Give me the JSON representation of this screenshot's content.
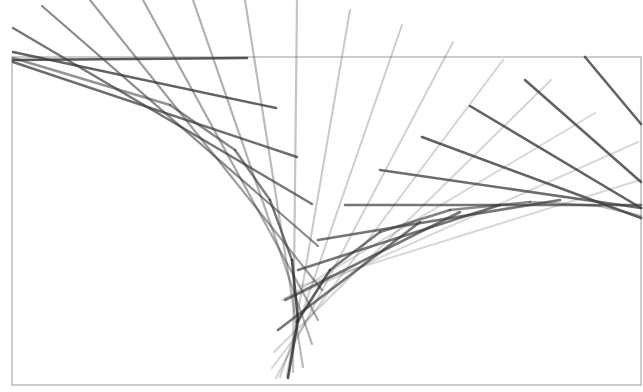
{
  "figure": {
    "width": 643,
    "height": 392,
    "background": "#ffffff",
    "frame": {
      "x": 12,
      "y": 57,
      "width": 629,
      "height": 328,
      "stroke": "#9a9a9a",
      "stroke_width": 1
    },
    "segments": [
      {
        "group": "left-envelope",
        "x1": 13,
        "y1": 60,
        "x2": 247,
        "y2": 58,
        "color": "#3c3c3c",
        "opacity": 0.85,
        "width": 2.6
      },
      {
        "group": "left-envelope",
        "x1": 13,
        "y1": 52,
        "x2": 276,
        "y2": 108,
        "color": "#3c3c3c",
        "opacity": 0.8,
        "width": 2.4
      },
      {
        "group": "left-envelope",
        "x1": 13,
        "y1": 62,
        "x2": 297,
        "y2": 157,
        "color": "#3c3c3c",
        "opacity": 0.75,
        "width": 2.4
      },
      {
        "group": "left-envelope",
        "x1": 13,
        "y1": 28,
        "x2": 312,
        "y2": 204,
        "color": "#3c3c3c",
        "opacity": 0.7,
        "width": 2.4
      },
      {
        "group": "left-envelope",
        "x1": 42,
        "y1": 6,
        "x2": 318,
        "y2": 246,
        "color": "#3c3c3c",
        "opacity": 0.6,
        "width": 2.2
      },
      {
        "group": "left-envelope",
        "x1": 90,
        "y1": 0,
        "x2": 322,
        "y2": 290,
        "color": "#3c3c3c",
        "opacity": 0.5,
        "width": 2.2
      },
      {
        "group": "left-envelope",
        "x1": 143,
        "y1": 0,
        "x2": 318,
        "y2": 320,
        "color": "#3c3c3c",
        "opacity": 0.45,
        "width": 2.2
      },
      {
        "group": "left-envelope",
        "x1": 193,
        "y1": 0,
        "x2": 312,
        "y2": 344,
        "color": "#3c3c3c",
        "opacity": 0.4,
        "width": 2.2
      },
      {
        "group": "left-envelope",
        "x1": 245,
        "y1": 0,
        "x2": 303,
        "y2": 367,
        "color": "#3c3c3c",
        "opacity": 0.35,
        "width": 2.2
      },
      {
        "group": "left-envelope",
        "x1": 297,
        "y1": 0,
        "x2": 293,
        "y2": 372,
        "color": "#3c3c3c",
        "opacity": 0.3,
        "width": 2.2
      },
      {
        "group": "left-envelope",
        "x1": 350,
        "y1": 10,
        "x2": 287,
        "y2": 376,
        "color": "#3c3c3c",
        "opacity": 0.28,
        "width": 2.0
      },
      {
        "group": "left-envelope",
        "x1": 402,
        "y1": 25,
        "x2": 280,
        "y2": 377,
        "color": "#3c3c3c",
        "opacity": 0.26,
        "width": 2.0
      },
      {
        "group": "left-envelope",
        "x1": 453,
        "y1": 42,
        "x2": 276,
        "y2": 378,
        "color": "#3c3c3c",
        "opacity": 0.24,
        "width": 2.0
      },
      {
        "group": "left-envelope",
        "x1": 503,
        "y1": 60,
        "x2": 272,
        "y2": 368,
        "color": "#3c3c3c",
        "opacity": 0.22,
        "width": 2.0
      },
      {
        "group": "left-envelope",
        "x1": 551,
        "y1": 80,
        "x2": 274,
        "y2": 352,
        "color": "#3c3c3c",
        "opacity": 0.22,
        "width": 2.0
      },
      {
        "group": "left-envelope",
        "x1": 595,
        "y1": 113,
        "x2": 282,
        "y2": 300,
        "color": "#3c3c3c",
        "opacity": 0.2,
        "width": 2.0
      },
      {
        "group": "left-envelope",
        "x1": 638,
        "y1": 142,
        "x2": 290,
        "y2": 298,
        "color": "#3c3c3c",
        "opacity": 0.2,
        "width": 2.0
      },
      {
        "group": "left-envelope",
        "x1": 640,
        "y1": 180,
        "x2": 300,
        "y2": 286,
        "color": "#3c3c3c",
        "opacity": 0.2,
        "width": 2.0
      },
      {
        "group": "right-envelope",
        "x1": 585,
        "y1": 57,
        "x2": 641,
        "y2": 124,
        "color": "#3c3c3c",
        "opacity": 0.8,
        "width": 2.6
      },
      {
        "group": "right-envelope",
        "x1": 525,
        "y1": 80,
        "x2": 641,
        "y2": 182,
        "color": "#3c3c3c",
        "opacity": 0.8,
        "width": 2.6
      },
      {
        "group": "right-envelope",
        "x1": 470,
        "y1": 106,
        "x2": 641,
        "y2": 208,
        "color": "#3c3c3c",
        "opacity": 0.8,
        "width": 2.6
      },
      {
        "group": "right-envelope",
        "x1": 422,
        "y1": 137,
        "x2": 641,
        "y2": 218,
        "color": "#3c3c3c",
        "opacity": 0.8,
        "width": 2.6
      },
      {
        "group": "right-envelope",
        "x1": 380,
        "y1": 170,
        "x2": 641,
        "y2": 208,
        "color": "#3c3c3c",
        "opacity": 0.75,
        "width": 2.6
      },
      {
        "group": "right-envelope",
        "x1": 345,
        "y1": 205,
        "x2": 641,
        "y2": 205,
        "color": "#3c3c3c",
        "opacity": 0.7,
        "width": 2.6
      },
      {
        "group": "right-envelope",
        "x1": 318,
        "y1": 240,
        "x2": 560,
        "y2": 200,
        "color": "#3c3c3c",
        "opacity": 0.7,
        "width": 2.6
      },
      {
        "group": "right-envelope",
        "x1": 298,
        "y1": 270,
        "x2": 500,
        "y2": 205,
        "color": "#3c3c3c",
        "opacity": 0.7,
        "width": 2.6
      },
      {
        "group": "right-envelope",
        "x1": 285,
        "y1": 300,
        "x2": 460,
        "y2": 212,
        "color": "#3c3c3c",
        "opacity": 0.7,
        "width": 2.6
      },
      {
        "group": "right-envelope",
        "x1": 278,
        "y1": 330,
        "x2": 420,
        "y2": 222,
        "color": "#3c3c3c",
        "opacity": 0.7,
        "width": 2.6
      },
      {
        "group": "left-curve",
        "x1": 13,
        "y1": 58,
        "x2": 170,
        "y2": 105,
        "color": "#3c3c3c",
        "opacity": 0.55,
        "width": 2.4
      },
      {
        "group": "left-curve",
        "x1": 170,
        "y1": 105,
        "x2": 235,
        "y2": 150,
        "color": "#3c3c3c",
        "opacity": 0.6,
        "width": 2.4
      },
      {
        "group": "left-curve",
        "x1": 235,
        "y1": 150,
        "x2": 270,
        "y2": 200,
        "color": "#3c3c3c",
        "opacity": 0.65,
        "width": 2.4
      },
      {
        "group": "left-curve",
        "x1": 270,
        "y1": 200,
        "x2": 292,
        "y2": 260,
        "color": "#3c3c3c",
        "opacity": 0.7,
        "width": 2.4
      },
      {
        "group": "left-curve",
        "x1": 292,
        "y1": 260,
        "x2": 298,
        "y2": 320,
        "color": "#2a2a2a",
        "opacity": 0.8,
        "width": 2.6
      },
      {
        "group": "left-curve",
        "x1": 298,
        "y1": 320,
        "x2": 288,
        "y2": 378,
        "color": "#2a2a2a",
        "opacity": 0.8,
        "width": 2.6
      },
      {
        "group": "right-curve",
        "x1": 297,
        "y1": 322,
        "x2": 330,
        "y2": 270,
        "color": "#2a2a2a",
        "opacity": 0.75,
        "width": 2.6
      },
      {
        "group": "right-curve",
        "x1": 330,
        "y1": 270,
        "x2": 380,
        "y2": 232,
        "color": "#3c3c3c",
        "opacity": 0.7,
        "width": 2.4
      },
      {
        "group": "right-curve",
        "x1": 380,
        "y1": 232,
        "x2": 450,
        "y2": 210,
        "color": "#3c3c3c",
        "opacity": 0.65,
        "width": 2.4
      },
      {
        "group": "right-curve",
        "x1": 450,
        "y1": 210,
        "x2": 530,
        "y2": 202,
        "color": "#3c3c3c",
        "opacity": 0.6,
        "width": 2.4
      },
      {
        "group": "right-curve",
        "x1": 530,
        "y1": 202,
        "x2": 600,
        "y2": 206,
        "color": "#3c3c3c",
        "opacity": 0.45,
        "width": 2.4
      },
      {
        "group": "right-curve",
        "x1": 600,
        "y1": 206,
        "x2": 641,
        "y2": 216,
        "color": "#3c3c3c",
        "opacity": 0.35,
        "width": 2.4
      }
    ]
  }
}
